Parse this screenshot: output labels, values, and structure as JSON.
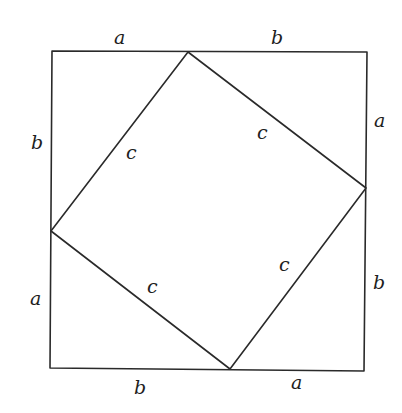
{
  "diagram": {
    "outer_square": {
      "corners": [
        [
          52,
          51
        ],
        [
          367,
          52
        ],
        [
          364,
          371
        ],
        [
          50,
          368
        ]
      ],
      "color": "#2a2a2a"
    },
    "inner_square": {
      "vertices": [
        [
          188,
          52
        ],
        [
          366,
          188
        ],
        [
          230,
          369
        ],
        [
          51,
          231
        ]
      ],
      "color": "#2a2a2a"
    },
    "labels": {
      "top_left_a": "a",
      "top_right_b": "b",
      "right_top_a": "a",
      "right_bottom_b": "b",
      "bottom_left_b": "b",
      "bottom_right_a": "a",
      "left_top_b": "b",
      "left_bottom_a": "a",
      "inner_top_left_c": "c",
      "inner_top_right_c": "c",
      "inner_bottom_right_c": "c",
      "inner_bottom_left_c": "c"
    }
  }
}
